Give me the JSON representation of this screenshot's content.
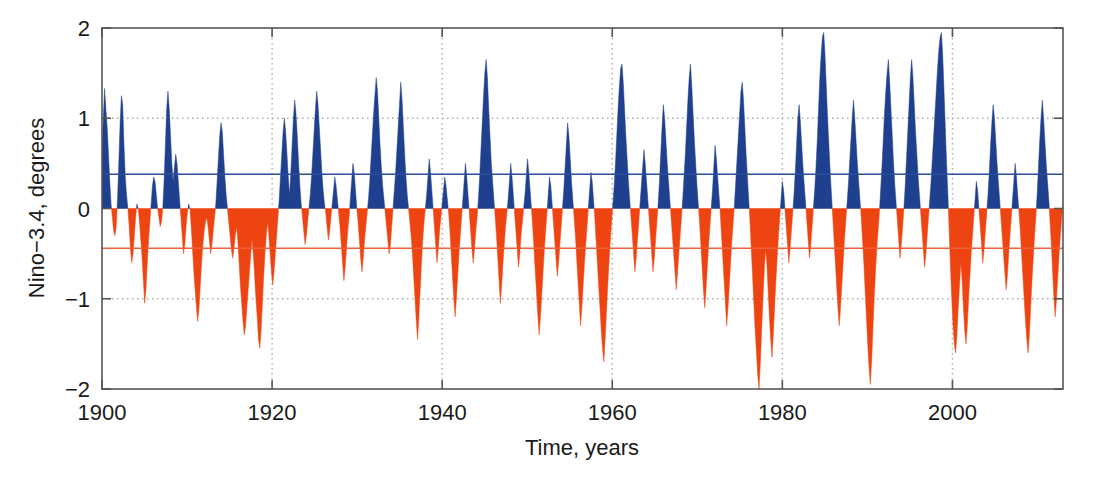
{
  "chart_data": {
    "type": "area",
    "title": "",
    "xlabel": "Time, years",
    "ylabel": "Nino−3.4, degrees",
    "xlim": [
      1900,
      2013
    ],
    "ylim": [
      -2,
      2
    ],
    "xticks": [
      1900,
      1920,
      1940,
      1960,
      1980,
      2000
    ],
    "xtick_labels": [
      "1900",
      "1920",
      "1940",
      "1960",
      "1980",
      "2000"
    ],
    "yticks": [
      -2,
      -1,
      0,
      1,
      2
    ],
    "ytick_labels": [
      "−2",
      "−1",
      "0",
      "1",
      "2"
    ],
    "grid": "dotted gridlines at y=+1 and y=-1 and at every x tick",
    "legend": "none",
    "colors": {
      "positive_fill": "#1F3F8F",
      "negative_fill": "#EE4411",
      "positive_mean_line": "#2B4E9B",
      "negative_mean_line": "#F2603A",
      "axis": "#555555",
      "grid": "#aaaaaa",
      "background": "#ffffff"
    },
    "annotations": [
      {
        "name": "positive-mean-line",
        "value": 0.38,
        "color": "#2B4E9B"
      },
      {
        "name": "negative-mean-line",
        "value": -0.44,
        "color": "#F2603A"
      }
    ],
    "series": [
      {
        "name": "Nino-3.4 anomaly",
        "x_start": 1900.0,
        "x_step": 0.08333,
        "values": [
          0.6,
          1.0,
          1.33,
          1.1,
          0.9,
          0.6,
          0.3,
          0.05,
          -0.1,
          -0.25,
          -0.3,
          -0.2,
          0.1,
          0.5,
          0.95,
          1.25,
          1.15,
          0.7,
          0.35,
          0.15,
          0.0,
          -0.2,
          -0.45,
          -0.6,
          -0.5,
          -0.3,
          -0.1,
          0.05,
          0.0,
          -0.15,
          -0.35,
          -0.55,
          -0.8,
          -1.05,
          -0.9,
          -0.6,
          -0.35,
          -0.15,
          0.05,
          0.25,
          0.35,
          0.3,
          0.15,
          0.0,
          -0.1,
          -0.2,
          -0.15,
          0.0,
          0.3,
          0.7,
          1.1,
          1.3,
          1.1,
          0.8,
          0.5,
          0.3,
          0.45,
          0.6,
          0.5,
          0.3,
          0.1,
          -0.1,
          -0.3,
          -0.5,
          -0.4,
          -0.2,
          -0.05,
          0.05,
          0.0,
          -0.2,
          -0.45,
          -0.7,
          -0.9,
          -1.1,
          -1.25,
          -1.1,
          -0.85,
          -0.6,
          -0.4,
          -0.25,
          -0.15,
          -0.1,
          -0.2,
          -0.35,
          -0.5,
          -0.4,
          -0.25,
          -0.1,
          0.05,
          0.3,
          0.55,
          0.8,
          0.95,
          0.85,
          0.6,
          0.35,
          0.15,
          0.0,
          -0.15,
          -0.3,
          -0.45,
          -0.55,
          -0.45,
          -0.3,
          -0.2,
          -0.35,
          -0.6,
          -0.85,
          -1.05,
          -1.25,
          -1.4,
          -1.3,
          -1.1,
          -0.9,
          -0.7,
          -0.5,
          -0.35,
          -0.5,
          -0.75,
          -1.0,
          -1.2,
          -1.45,
          -1.55,
          -1.35,
          -1.05,
          -0.75,
          -0.5,
          -0.3,
          -0.15,
          -0.3,
          -0.5,
          -0.7,
          -0.85,
          -0.7,
          -0.5,
          -0.3,
          -0.1,
          0.1,
          0.35,
          0.6,
          0.85,
          1.0,
          0.85,
          0.6,
          0.35,
          0.15,
          0.4,
          0.7,
          1.0,
          1.2,
          1.05,
          0.8,
          0.5,
          0.25,
          0.05,
          -0.1,
          -0.25,
          -0.4,
          -0.3,
          -0.15,
          0.0,
          0.15,
          0.35,
          0.6,
          0.85,
          1.1,
          1.3,
          1.15,
          0.9,
          0.65,
          0.4,
          0.2,
          0.05,
          -0.05,
          -0.2,
          -0.35,
          -0.25,
          -0.1,
          0.05,
          0.2,
          0.35,
          0.25,
          0.1,
          -0.05,
          -0.2,
          -0.4,
          -0.6,
          -0.8,
          -0.65,
          -0.45,
          -0.25,
          -0.1,
          0.1,
          0.3,
          0.5,
          0.4,
          0.2,
          0.0,
          -0.15,
          -0.35,
          -0.55,
          -0.7,
          -0.55,
          -0.35,
          -0.2,
          -0.05,
          0.1,
          0.3,
          0.55,
          0.8,
          1.05,
          1.25,
          1.45,
          1.3,
          1.0,
          0.7,
          0.45,
          0.25,
          0.1,
          -0.05,
          -0.2,
          -0.35,
          -0.5,
          -0.4,
          -0.2,
          0.0,
          0.2,
          0.4,
          0.65,
          0.9,
          1.15,
          1.4,
          1.2,
          0.9,
          0.6,
          0.35,
          0.15,
          0.0,
          -0.15,
          -0.3,
          -0.5,
          -0.75,
          -1.0,
          -1.25,
          -1.45,
          -1.2,
          -0.9,
          -0.6,
          -0.35,
          -0.15,
          0.0,
          0.15,
          0.35,
          0.55,
          0.4,
          0.2,
          0.0,
          -0.2,
          -0.4,
          -0.6,
          -0.45,
          -0.25,
          -0.1,
          0.05,
          0.2,
          0.35,
          0.25,
          0.1,
          -0.05,
          -0.25,
          -0.5,
          -0.75,
          -1.0,
          -1.2,
          -1.0,
          -0.75,
          -0.5,
          -0.3,
          -0.1,
          0.1,
          0.3,
          0.5,
          0.35,
          0.15,
          -0.05,
          -0.25,
          -0.45,
          -0.6,
          -0.45,
          -0.25,
          -0.1,
          0.1,
          0.35,
          0.65,
          0.95,
          1.25,
          1.5,
          1.65,
          1.45,
          1.1,
          0.8,
          0.5,
          0.3,
          0.1,
          -0.1,
          -0.3,
          -0.55,
          -0.8,
          -1.05,
          -0.85,
          -0.6,
          -0.4,
          -0.2,
          -0.05,
          0.1,
          0.3,
          0.5,
          0.35,
          0.15,
          -0.05,
          -0.25,
          -0.45,
          -0.65,
          -0.5,
          -0.3,
          -0.15,
          0.0,
          0.15,
          0.35,
          0.55,
          0.4,
          0.2,
          0.0,
          -0.2,
          -0.45,
          -0.7,
          -0.95,
          -1.2,
          -1.4,
          -1.2,
          -0.95,
          -0.7,
          -0.45,
          -0.25,
          -0.05,
          0.15,
          0.35,
          0.25,
          0.05,
          -0.15,
          -0.35,
          -0.55,
          -0.75,
          -0.6,
          -0.4,
          -0.2,
          0.0,
          0.2,
          0.45,
          0.7,
          0.95,
          0.8,
          0.55,
          0.3,
          0.1,
          -0.1,
          -0.3,
          -0.55,
          -0.8,
          -1.05,
          -1.3,
          -1.1,
          -0.85,
          -0.6,
          -0.4,
          -0.2,
          0.0,
          0.2,
          0.4,
          0.3,
          0.1,
          -0.1,
          -0.35,
          -0.6,
          -0.85,
          -1.1,
          -1.35,
          -1.55,
          -1.7,
          -1.45,
          -1.15,
          -0.85,
          -0.6,
          -0.35,
          -0.15,
          0.05,
          0.25,
          0.5,
          0.8,
          1.1,
          1.35,
          1.55,
          1.6,
          1.4,
          1.1,
          0.8,
          0.55,
          0.3,
          0.1,
          -0.1,
          -0.3,
          -0.5,
          -0.7,
          -0.55,
          -0.35,
          -0.15,
          0.05,
          0.25,
          0.45,
          0.65,
          0.5,
          0.3,
          0.1,
          -0.1,
          -0.3,
          -0.5,
          -0.7,
          -0.55,
          -0.35,
          -0.15,
          0.05,
          0.3,
          0.6,
          0.9,
          1.15,
          1.0,
          0.75,
          0.5,
          0.3,
          0.1,
          -0.1,
          -0.3,
          -0.5,
          -0.7,
          -0.9,
          -0.7,
          -0.5,
          -0.3,
          -0.1,
          0.1,
          0.35,
          0.6,
          0.9,
          1.2,
          1.45,
          1.6,
          1.35,
          1.05,
          0.75,
          0.5,
          0.25,
          0.05,
          -0.15,
          -0.4,
          -0.65,
          -0.9,
          -1.1,
          -0.9,
          -0.65,
          -0.4,
          -0.2,
          0.0,
          0.2,
          0.45,
          0.7,
          0.55,
          0.35,
          0.15,
          -0.05,
          -0.3,
          -0.55,
          -0.8,
          -1.05,
          -1.3,
          -1.1,
          -0.85,
          -0.6,
          -0.35,
          -0.15,
          0.05,
          0.3,
          0.55,
          0.8,
          1.05,
          1.3,
          1.4,
          1.2,
          0.9,
          0.6,
          0.35,
          0.1,
          -0.15,
          -0.45,
          -0.75,
          -1.05,
          -1.35,
          -1.6,
          -1.85,
          -2.0,
          -1.7,
          -1.35,
          -1.0,
          -0.7,
          -0.45,
          -0.6,
          -0.9,
          -1.2,
          -1.45,
          -1.65,
          -1.4,
          -1.1,
          -0.8,
          -0.55,
          -0.3,
          -0.1,
          0.1,
          0.3,
          0.2,
          0.0,
          -0.2,
          -0.4,
          -0.6,
          -0.45,
          -0.25,
          -0.05,
          0.15,
          0.4,
          0.7,
          1.0,
          1.15,
          0.95,
          0.7,
          0.45,
          0.25,
          0.05,
          -0.15,
          -0.35,
          -0.55,
          -0.4,
          -0.2,
          0.0,
          0.2,
          0.45,
          0.75,
          1.1,
          1.45,
          1.7,
          1.9,
          1.95,
          1.7,
          1.35,
          1.0,
          0.7,
          0.4,
          0.15,
          -0.1,
          -0.35,
          -0.6,
          -0.85,
          -1.1,
          -1.3,
          -1.1,
          -0.85,
          -0.6,
          -0.35,
          -0.15,
          0.05,
          0.25,
          0.5,
          0.75,
          1.0,
          1.2,
          1.0,
          0.75,
          0.5,
          0.3,
          0.1,
          -0.1,
          -0.35,
          -0.6,
          -0.9,
          -1.2,
          -1.5,
          -1.75,
          -1.95,
          -1.7,
          -1.35,
          -1.0,
          -0.7,
          -0.45,
          -0.25,
          -0.05,
          0.2,
          0.45,
          0.75,
          1.05,
          1.3,
          1.5,
          1.65,
          1.4,
          1.1,
          0.8,
          0.5,
          0.25,
          0.05,
          -0.15,
          -0.35,
          -0.55,
          -0.4,
          -0.2,
          0.0,
          0.25,
          0.55,
          0.85,
          1.15,
          1.45,
          1.65,
          1.45,
          1.15,
          0.85,
          0.6,
          0.35,
          0.15,
          -0.05,
          -0.25,
          -0.45,
          -0.65,
          -0.5,
          -0.3,
          -0.1,
          0.1,
          0.3,
          0.55,
          0.8,
          1.05,
          1.3,
          1.55,
          1.75,
          1.9,
          1.95,
          1.7,
          1.3,
          0.9,
          0.5,
          0.15,
          -0.25,
          -0.65,
          -1.0,
          -1.3,
          -1.5,
          -1.6,
          -1.4,
          -1.1,
          -0.85,
          -0.6,
          -0.8,
          -1.1,
          -1.35,
          -1.5,
          -1.3,
          -1.0,
          -0.75,
          -0.5,
          -0.3,
          -0.1,
          0.1,
          0.3,
          0.2,
          0.0,
          -0.2,
          -0.4,
          -0.6,
          -0.45,
          -0.25,
          -0.05,
          0.15,
          0.4,
          0.7,
          0.95,
          1.15,
          1.0,
          0.75,
          0.5,
          0.3,
          0.1,
          -0.1,
          -0.3,
          -0.5,
          -0.7,
          -0.9,
          -0.75,
          -0.5,
          -0.3,
          -0.1,
          0.1,
          0.3,
          0.5,
          0.35,
          0.15,
          -0.05,
          -0.25,
          -0.5,
          -0.75,
          -1.0,
          -1.25,
          -1.45,
          -1.6,
          -1.4,
          -1.1,
          -0.8,
          -0.55,
          -0.3,
          -0.1,
          0.15,
          0.45,
          0.75,
          1.0,
          1.2,
          1.0,
          0.75,
          0.5,
          0.3,
          0.1,
          -0.15,
          -0.4,
          -0.7,
          -1.0,
          -1.2,
          -1.0,
          -0.75,
          -0.5,
          -0.3,
          -0.1,
          0.05
        ]
      }
    ]
  },
  "axis": {
    "ylabel": "Nino−3.4, degrees",
    "xlabel": "Time, years",
    "yticks": [
      "2",
      "1",
      "0",
      "−1",
      "−2"
    ],
    "xticks": [
      "1900",
      "1920",
      "1940",
      "1960",
      "1980",
      "2000"
    ]
  }
}
